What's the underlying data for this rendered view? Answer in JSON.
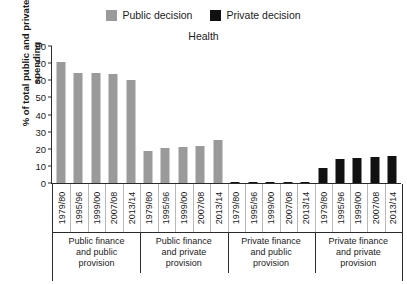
{
  "legend": {
    "entries": [
      {
        "label": "Public decision",
        "color": "#9a9a9a",
        "key": "public"
      },
      {
        "label": "Private decision",
        "color": "#111111",
        "key": "private"
      }
    ]
  },
  "axis": {
    "yticks": [
      "0",
      "10",
      "20",
      "30",
      "40",
      "50",
      "60",
      "70",
      "80"
    ]
  },
  "chart_data": {
    "type": "bar",
    "title": "Health",
    "xlabel": "",
    "ylabel": "% of total public and private spending",
    "ylim": [
      0,
      80
    ],
    "ytick_step": 10,
    "grid": false,
    "legend_position": "top-center",
    "categories": [
      "1979/80",
      "1995/96",
      "1999/00",
      "2007/08",
      "2013/14",
      "1979/80",
      "1995/96",
      "1999/00",
      "2007/08",
      "2013/14",
      "1979/80",
      "1995/96",
      "1999/00",
      "2007/08",
      "2013/14",
      "1979/80",
      "1995/96",
      "1999/00",
      "2007/08",
      "2013/14"
    ],
    "groups": [
      {
        "label": "Public finance and public provision",
        "label_lines": [
          "Public finance",
          "and public",
          "provision"
        ],
        "series": "Public decision",
        "color": "#9a9a9a",
        "categories": [
          "1979/80",
          "1995/96",
          "1999/00",
          "2007/08",
          "2013/14"
        ],
        "values": [
          70.5,
          64.0,
          64.5,
          63.5,
          60.0
        ]
      },
      {
        "label": "Public finance and private provision",
        "label_lines": [
          "Public finance",
          "and private",
          "provision"
        ],
        "series": "Public decision",
        "color": "#9a9a9a",
        "categories": [
          "1979/80",
          "1995/96",
          "1999/00",
          "2007/08",
          "2013/14"
        ],
        "values": [
          18.5,
          20.5,
          21.0,
          21.5,
          25.0
        ]
      },
      {
        "label": "Private finance and public provision",
        "label_lines": [
          "Private finance",
          "and public",
          "provision"
        ],
        "series": "Private decision",
        "color": "#111111",
        "categories": [
          "1979/80",
          "1995/96",
          "1999/00",
          "2007/08",
          "2013/14"
        ],
        "values": [
          0.5,
          0.5,
          0.5,
          0.5,
          0.5
        ]
      },
      {
        "label": "Private finance and private provision",
        "label_lines": [
          "Private finance",
          "and private",
          "provision"
        ],
        "series": "Private decision",
        "color": "#111111",
        "categories": [
          "1979/80",
          "1995/96",
          "1999/00",
          "2007/08",
          "2013/14"
        ],
        "values": [
          9.0,
          14.0,
          14.5,
          15.0,
          16.0
        ]
      }
    ]
  }
}
